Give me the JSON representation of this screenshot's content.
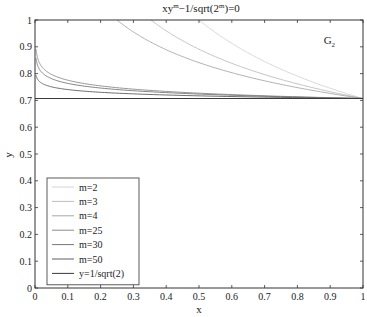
{
  "chart_data": {
    "type": "line",
    "title_parts": {
      "base": "xy",
      "sup1": "m",
      "mid": "−1/sqrt(2",
      "sup2": "m",
      "end": ")=0"
    },
    "xlabel": "x",
    "ylabel": "y",
    "xlim": [
      0,
      1
    ],
    "ylim": [
      0,
      1
    ],
    "xticks": [
      0,
      0.1,
      0.2,
      0.3,
      0.4,
      0.5,
      0.6,
      0.7,
      0.8,
      0.9,
      1
    ],
    "xtick_labels": [
      "0",
      "0.1",
      "0.2",
      "0.3",
      "0.4",
      "0.5",
      "0.6",
      "0.7",
      "0.8",
      "0.9",
      "1"
    ],
    "yticks": [
      0,
      0.1,
      0.2,
      0.3,
      0.4,
      0.5,
      0.6,
      0.7,
      0.8,
      0.9,
      1
    ],
    "ytick_labels": [
      "0",
      "0.1",
      "0.2",
      "0.3",
      "0.4",
      "0.5",
      "0.6",
      "0.7",
      "0.8",
      "0.9",
      "1"
    ],
    "grid": false,
    "legend_position": "lower left",
    "annotation": {
      "text": "G",
      "subscript": "2",
      "x": 0.88,
      "y": 0.91
    },
    "formula": "y = (1/sqrt(2)) * x^(-1/m), clipped to y<=1",
    "series": [
      {
        "name": "m=2",
        "m": 2,
        "color": "#d4d4d4",
        "points": [
          [
            0.5,
            1.0
          ],
          [
            0.6,
            0.913
          ],
          [
            0.7,
            0.845
          ],
          [
            0.8,
            0.791
          ],
          [
            0.9,
            0.745
          ],
          [
            1.0,
            0.707
          ]
        ]
      },
      {
        "name": "m=3",
        "m": 3,
        "color": "#bdbdbd",
        "points": [
          [
            0.354,
            1.0
          ],
          [
            0.4,
            0.96
          ],
          [
            0.5,
            0.891
          ],
          [
            0.6,
            0.838
          ],
          [
            0.7,
            0.796
          ],
          [
            0.8,
            0.762
          ],
          [
            0.9,
            0.732
          ],
          [
            1.0,
            0.707
          ]
        ]
      },
      {
        "name": "m=4",
        "m": 4,
        "color": "#a8a8a8",
        "points": [
          [
            0.25,
            1.0
          ],
          [
            0.3,
            0.955
          ],
          [
            0.4,
            0.889
          ],
          [
            0.5,
            0.841
          ],
          [
            0.6,
            0.803
          ],
          [
            0.7,
            0.773
          ],
          [
            0.8,
            0.748
          ],
          [
            0.9,
            0.726
          ],
          [
            1.0,
            0.707
          ]
        ]
      },
      {
        "name": "m=25",
        "m": 25,
        "color": "#8c8c8c",
        "points": [
          [
            0.003,
            0.892
          ],
          [
            0.01,
            0.85
          ],
          [
            0.05,
            0.797
          ],
          [
            0.1,
            0.775
          ],
          [
            0.2,
            0.753
          ],
          [
            0.4,
            0.733
          ],
          [
            0.6,
            0.722
          ],
          [
            0.8,
            0.713
          ],
          [
            1.0,
            0.707
          ]
        ]
      },
      {
        "name": "m=30",
        "m": 30,
        "color": "#777777",
        "points": [
          [
            0.003,
            0.858
          ],
          [
            0.01,
            0.825
          ],
          [
            0.05,
            0.781
          ],
          [
            0.1,
            0.763
          ],
          [
            0.2,
            0.745
          ],
          [
            0.4,
            0.729
          ],
          [
            0.6,
            0.719
          ],
          [
            0.8,
            0.712
          ],
          [
            1.0,
            0.707
          ]
        ]
      },
      {
        "name": "m=50",
        "m": 50,
        "color": "#5e5e5e",
        "points": [
          [
            0.003,
            0.794
          ],
          [
            0.01,
            0.775
          ],
          [
            0.05,
            0.75
          ],
          [
            0.1,
            0.74
          ],
          [
            0.2,
            0.73
          ],
          [
            0.4,
            0.72
          ],
          [
            0.6,
            0.714
          ],
          [
            0.8,
            0.71
          ],
          [
            1.0,
            0.707
          ]
        ]
      },
      {
        "name": "y=1/sqrt(2)",
        "m": null,
        "color": "#3a3a3a",
        "points": [
          [
            0,
            0.7071
          ],
          [
            1,
            0.7071
          ]
        ]
      }
    ]
  }
}
